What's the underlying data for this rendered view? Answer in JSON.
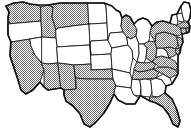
{
  "map": {
    "title": "United States choropleth map",
    "description": "Outline map of the contiguous United States with individual state borders; a subset of states is filled with a gray hatch/stipple pattern while the remainder are left white.",
    "projection": "albers-usa",
    "colors": {
      "background": "#ffffff",
      "state_fill_plain": "#ffffff",
      "state_fill_hatched": "#8c8c8c",
      "state_border": "#1a1a1a",
      "country_outline": "#111111"
    },
    "legend": {
      "visible": false,
      "categories": [
        {
          "key": "hatched",
          "label": "Selected / highlighted",
          "pattern": "gray-hatch"
        },
        {
          "key": "plain",
          "label": "Not selected",
          "pattern": "white"
        }
      ]
    },
    "counts": {
      "hatched": 23,
      "plain": 26,
      "total_drawn": 49
    },
    "states": [
      {
        "code": "WA",
        "name": "Washington",
        "status": "hatched"
      },
      {
        "code": "OR",
        "name": "Oregon",
        "status": "plain"
      },
      {
        "code": "CA",
        "name": "California",
        "status": "hatched"
      },
      {
        "code": "NV",
        "name": "Nevada",
        "status": "plain"
      },
      {
        "code": "ID",
        "name": "Idaho",
        "status": "hatched"
      },
      {
        "code": "MT",
        "name": "Montana",
        "status": "hatched"
      },
      {
        "code": "WY",
        "name": "Wyoming",
        "status": "plain"
      },
      {
        "code": "UT",
        "name": "Utah",
        "status": "plain"
      },
      {
        "code": "AZ",
        "name": "Arizona",
        "status": "hatched"
      },
      {
        "code": "CO",
        "name": "Colorado",
        "status": "plain"
      },
      {
        "code": "NM",
        "name": "New Mexico",
        "status": "hatched"
      },
      {
        "code": "ND",
        "name": "North Dakota",
        "status": "plain"
      },
      {
        "code": "SD",
        "name": "South Dakota",
        "status": "plain"
      },
      {
        "code": "NE",
        "name": "Nebraska",
        "status": "plain"
      },
      {
        "code": "KS",
        "name": "Kansas",
        "status": "plain"
      },
      {
        "code": "OK",
        "name": "Oklahoma",
        "status": "hatched"
      },
      {
        "code": "TX",
        "name": "Texas",
        "status": "hatched"
      },
      {
        "code": "MN",
        "name": "Minnesota",
        "status": "plain"
      },
      {
        "code": "IA",
        "name": "Iowa",
        "status": "plain"
      },
      {
        "code": "MO",
        "name": "Missouri",
        "status": "plain"
      },
      {
        "code": "AR",
        "name": "Arkansas",
        "status": "plain"
      },
      {
        "code": "LA",
        "name": "Louisiana",
        "status": "plain"
      },
      {
        "code": "WI",
        "name": "Wisconsin",
        "status": "hatched"
      },
      {
        "code": "IL",
        "name": "Illinois",
        "status": "plain"
      },
      {
        "code": "MS",
        "name": "Mississippi",
        "status": "plain"
      },
      {
        "code": "MI",
        "name": "Michigan",
        "status": "plain"
      },
      {
        "code": "IN",
        "name": "Indiana",
        "status": "plain"
      },
      {
        "code": "OH",
        "name": "Ohio",
        "status": "hatched"
      },
      {
        "code": "KY",
        "name": "Kentucky",
        "status": "hatched"
      },
      {
        "code": "TN",
        "name": "Tennessee",
        "status": "hatched"
      },
      {
        "code": "AL",
        "name": "Alabama",
        "status": "plain"
      },
      {
        "code": "GA",
        "name": "Georgia",
        "status": "plain"
      },
      {
        "code": "FL",
        "name": "Florida",
        "status": "hatched"
      },
      {
        "code": "SC",
        "name": "South Carolina",
        "status": "plain"
      },
      {
        "code": "NC",
        "name": "North Carolina",
        "status": "hatched"
      },
      {
        "code": "VA",
        "name": "Virginia",
        "status": "hatched"
      },
      {
        "code": "WV",
        "name": "West Virginia",
        "status": "plain"
      },
      {
        "code": "MD",
        "name": "Maryland",
        "status": "hatched"
      },
      {
        "code": "DE",
        "name": "Delaware",
        "status": "hatched"
      },
      {
        "code": "PA",
        "name": "Pennsylvania",
        "status": "hatched"
      },
      {
        "code": "NJ",
        "name": "New Jersey",
        "status": "hatched"
      },
      {
        "code": "NY",
        "name": "New York",
        "status": "hatched"
      },
      {
        "code": "CT",
        "name": "Connecticut",
        "status": "hatched"
      },
      {
        "code": "RI",
        "name": "Rhode Island",
        "status": "hatched"
      },
      {
        "code": "MA",
        "name": "Massachusetts",
        "status": "hatched"
      },
      {
        "code": "VT",
        "name": "Vermont",
        "status": "plain"
      },
      {
        "code": "NH",
        "name": "New Hampshire",
        "status": "plain"
      },
      {
        "code": "ME",
        "name": "Maine",
        "status": "plain"
      }
    ]
  }
}
